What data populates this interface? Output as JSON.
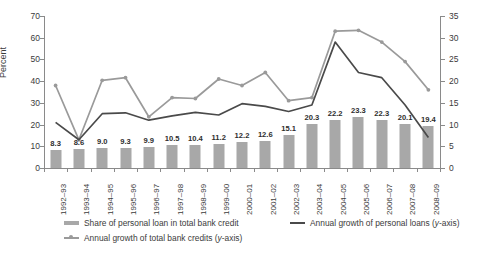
{
  "chart_data": {
    "type": "bar",
    "title": "",
    "xlabel": "",
    "ylabel": "Percent",
    "ylim": [
      0,
      70
    ],
    "y2lim": [
      0,
      35
    ],
    "grid": false,
    "legend_position": "bottom-left",
    "categories": [
      "1992–93",
      "1993–94",
      "1994–95",
      "1995–96",
      "1996–97",
      "1997–98",
      "1998–99",
      "1999–00",
      "2000–01",
      "2001–02",
      "2002–03",
      "2003–04",
      "2004–05",
      "2005–06",
      "2006–07",
      "2007–08",
      "2008–09"
    ],
    "yticks": [
      0,
      10,
      20,
      30,
      40,
      50,
      60,
      70
    ],
    "y2ticks": [
      0,
      5,
      10,
      15,
      20,
      25,
      30,
      35
    ],
    "series": [
      {
        "name": "Share of personal loan in total bank credit",
        "type": "bar",
        "axis": "left",
        "color": "#a8a8a8",
        "values": [
          8.3,
          8.6,
          9.0,
          9.3,
          9.9,
          10.5,
          10.4,
          11.2,
          12.2,
          12.6,
          15.1,
          20.3,
          22.2,
          23.3,
          22.3,
          20.1,
          19.4
        ],
        "data_labels": [
          "8.3",
          "8.6",
          "9.0",
          "9.3",
          "9.9",
          "10.5",
          "10.4",
          "11.2",
          "12.2",
          "12.6",
          "15.1",
          "20.3",
          "22.2",
          "23.3",
          "22.3",
          "20.1",
          "19.4"
        ]
      },
      {
        "name": "Annual growth of personal loans (y-axis)",
        "type": "line",
        "axis": "right",
        "color": "#9a9a9a",
        "marker": "circle",
        "values": [
          19.0,
          6.5,
          20.2,
          20.8,
          11.8,
          16.2,
          16.0,
          20.5,
          19.0,
          22.0,
          15.5,
          16.2,
          31.5,
          31.7,
          29.0,
          24.5,
          18.0
        ]
      },
      {
        "name": "Annual growth of total bank credits (y-axis)",
        "type": "line",
        "axis": "right",
        "color": "#4a4a4a",
        "marker": "none",
        "values": [
          10.5,
          6.5,
          12.5,
          12.7,
          11.0,
          12.0,
          12.8,
          12.2,
          14.8,
          14.2,
          13.0,
          14.5,
          29.0,
          22.0,
          20.8,
          14.5,
          7.0
        ]
      }
    ]
  },
  "legend": {
    "items": [
      {
        "label": "Share of personal loan in total bank credit",
        "suffix": ""
      },
      {
        "label": "Annual growth of personal loans (",
        "suffix": "y",
        "tail": "-axis)"
      },
      {
        "label": "Annual growth of total bank credits (",
        "suffix": "y",
        "tail": "-axis)"
      }
    ]
  }
}
